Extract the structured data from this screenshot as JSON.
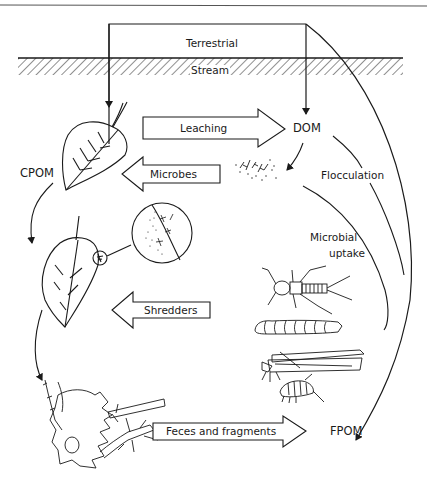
{
  "diagram": {
    "zones": {
      "terrestrial": "Terrestrial",
      "stream": "Stream"
    },
    "pools": {
      "cpom": "CPOM",
      "dom": "DOM",
      "fpom": "FPOM"
    },
    "processes": {
      "leaching": "Leaching",
      "microbes": "Microbes",
      "shredders": "Shredders",
      "feces_fragments": "Feces and fragments",
      "flocculation": "Flocculation",
      "microbial_uptake_line1": "Microbial",
      "microbial_uptake_line2": "uptake"
    },
    "colors": {
      "ink": "#1a1a1a",
      "background": "#ffffff"
    }
  }
}
